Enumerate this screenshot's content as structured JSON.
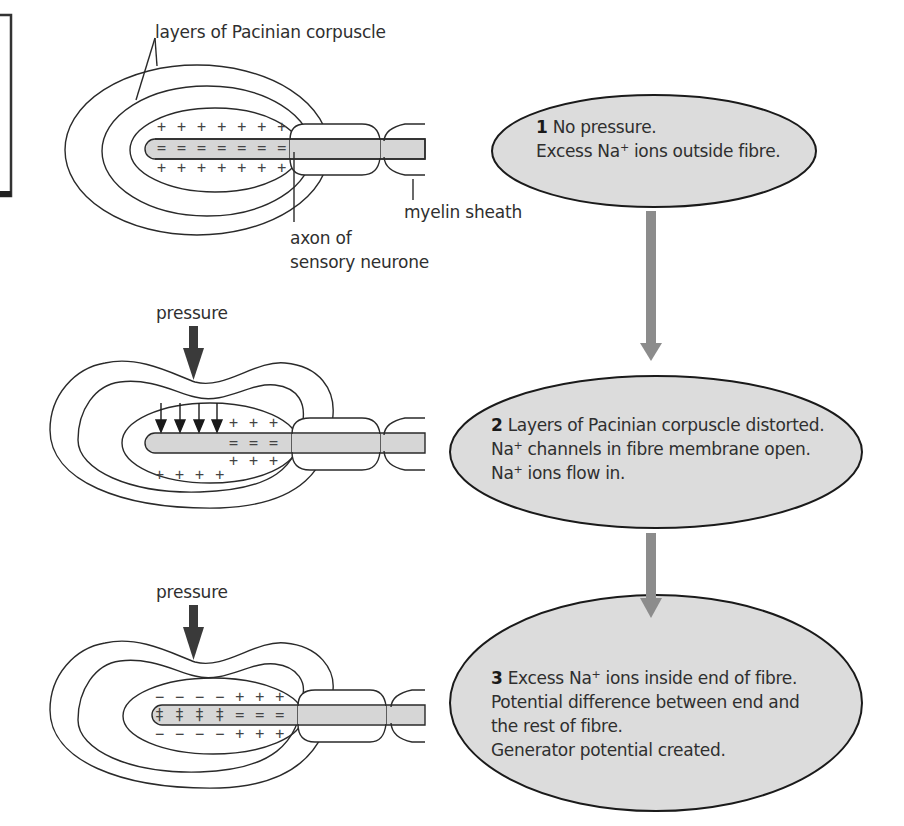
{
  "labels": {
    "layers": "layers of Pacinian corpuscle",
    "myelin": "myelin sheath",
    "axon_line1": "axon of",
    "axon_line2": "sensory neurone",
    "pressure_2": "pressure",
    "pressure_3": "pressure"
  },
  "steps": [
    {
      "number": "1",
      "lines": [
        {
          "pre": "No pressure.",
          "sup": "",
          "post": ""
        },
        {
          "pre": "Excess Na",
          "sup": "+",
          "post": " ions outside fibre."
        }
      ]
    },
    {
      "number": "2",
      "lines": [
        {
          "pre": "Layers of Pacinian corpuscle distorted.",
          "sup": "",
          "post": ""
        },
        {
          "pre": "Na",
          "sup": "+",
          "post": " channels in fibre membrane open."
        },
        {
          "pre": "Na",
          "sup": "+",
          "post": " ions flow in."
        }
      ]
    },
    {
      "number": "3",
      "lines": [
        {
          "pre": "Excess Na",
          "sup": "+",
          "post": " ions inside end of fibre."
        },
        {
          "pre": "Potential difference between end and",
          "sup": "",
          "post": ""
        },
        {
          "pre": "the rest of fibre.",
          "sup": "",
          "post": ""
        },
        {
          "pre": "Generator potential created.",
          "sup": "",
          "post": ""
        }
      ]
    }
  ],
  "charges": {
    "d1_top": "+ + + + + + +",
    "d1_mid": "= = = = = = =",
    "d1_bot": "+ + + + + + +",
    "d2_top": "+ + +",
    "d2_mid": "= = =",
    "d2_bot_right": "+ + +",
    "d2_bot_left": "+ + + +",
    "d3_top": "− − − − + + +",
    "d3_mid": "‡ ‡ ‡ ‡ = = =",
    "d3_bot": "− − − − + + +"
  },
  "colors": {
    "fill_grey": "#d9d9d9",
    "arrow_grey": "#8c8c8c",
    "pressure_arrow": "#3a3a3a",
    "line": "#2a2a2a"
  }
}
